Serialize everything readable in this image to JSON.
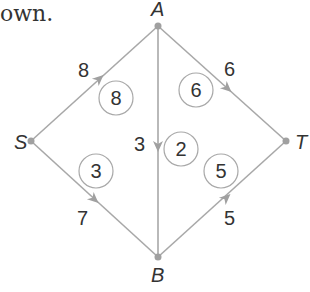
{
  "caption_fragment": "own.",
  "diagram": {
    "type": "network-flow",
    "nodes": [
      {
        "id": "S",
        "label": "S",
        "x": 31,
        "y": 141
      },
      {
        "id": "A",
        "label": "A",
        "x": 158,
        "y": 26
      },
      {
        "id": "T",
        "label": "T",
        "x": 286,
        "y": 141
      },
      {
        "id": "B",
        "label": "B",
        "x": 158,
        "y": 257
      }
    ],
    "edges": [
      {
        "from": "S",
        "to": "A",
        "capacity": "8",
        "flow": "8"
      },
      {
        "from": "A",
        "to": "T",
        "capacity": "6",
        "flow": "6"
      },
      {
        "from": "A",
        "to": "B",
        "capacity": "3",
        "flow": "2"
      },
      {
        "from": "S",
        "to": "B",
        "capacity": "7",
        "flow": "3"
      },
      {
        "from": "B",
        "to": "T",
        "capacity": "5",
        "flow": "5"
      }
    ],
    "colors": {
      "edge": "#a8a8a8",
      "text": "#333333",
      "node": "#a0a0a0"
    }
  }
}
